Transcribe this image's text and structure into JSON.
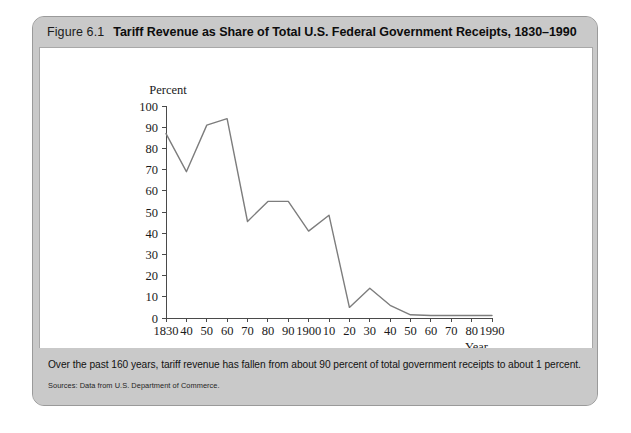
{
  "figure": {
    "number_label": "Figure 6.1",
    "title": "Tariff Revenue as Share of Total U.S. Federal Government Receipts, 1830–1990",
    "caption": "Over the past 160 years, tariff revenue has fallen from about 90 percent of total government receipts to about 1 percent.",
    "source": "Sources: Data from U.S. Department of Commerce."
  },
  "colors": {
    "frame_background": "#c9c9c9",
    "plot_background": "#ffffff",
    "line_color": "#7d7d7d",
    "axis_color": "#4a4a4a",
    "title_color": "#0d0d0d"
  },
  "chart_data": {
    "type": "line",
    "title": "Tariff Revenue as Share of Total U.S. Federal Government Receipts, 1830–1990",
    "xlabel": "Year",
    "ylabel": "Percent",
    "grid": false,
    "legend": "none",
    "xlim": [
      1830,
      1990
    ],
    "ylim": [
      0,
      100
    ],
    "y_ticks": [
      0,
      10,
      20,
      30,
      40,
      50,
      60,
      70,
      80,
      90,
      100
    ],
    "y_tick_labels": [
      "0",
      "10",
      "20",
      "30",
      "40",
      "50",
      "60",
      "70",
      "80",
      "90",
      "100"
    ],
    "x_ticks": [
      1830,
      1840,
      1850,
      1860,
      1870,
      1880,
      1890,
      1900,
      1910,
      1920,
      1930,
      1940,
      1950,
      1960,
      1970,
      1980,
      1990
    ],
    "x_tick_labels": [
      "1830",
      "40",
      "50",
      "60",
      "70",
      "80",
      "90",
      "1900",
      "10",
      "20",
      "30",
      "40",
      "50",
      "60",
      "70",
      "80",
      "1990"
    ],
    "x": [
      1830,
      1840,
      1850,
      1860,
      1870,
      1880,
      1890,
      1900,
      1910,
      1920,
      1930,
      1940,
      1950,
      1960,
      1970,
      1980,
      1990
    ],
    "values": [
      87,
      69,
      91,
      94,
      45.5,
      55,
      55,
      41,
      48.5,
      5,
      14,
      6,
      1.5,
      1.2,
      1.2,
      1.2,
      1.2
    ],
    "series": [
      {
        "name": "Tariff revenue share of total federal receipts",
        "values": [
          87,
          69,
          91,
          94,
          45.5,
          55,
          55,
          41,
          48.5,
          5,
          14,
          6,
          1.5,
          1.2,
          1.2,
          1.2,
          1.2
        ]
      }
    ]
  }
}
